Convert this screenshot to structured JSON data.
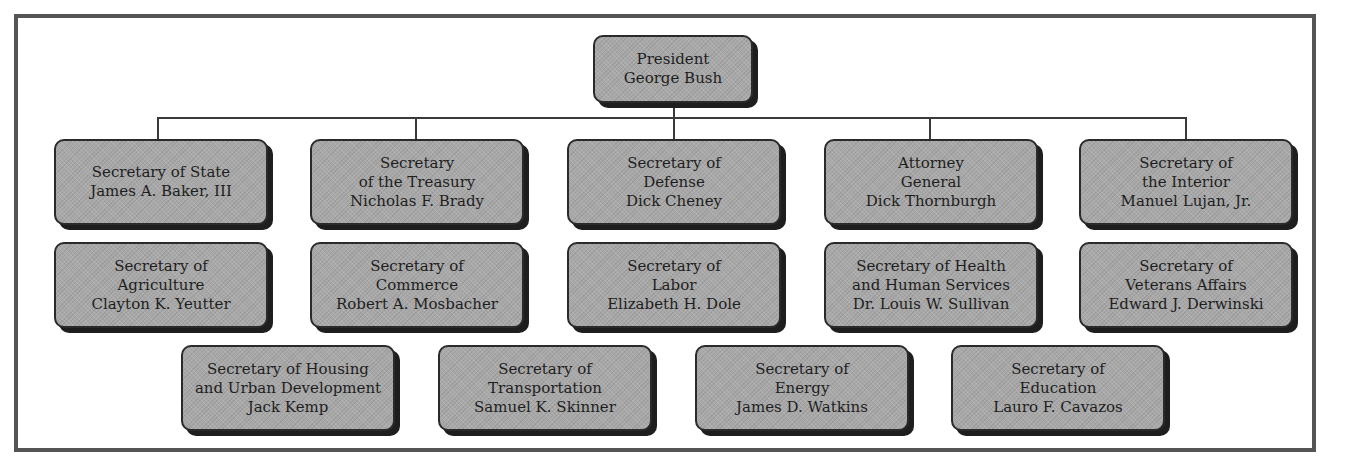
{
  "chart_title": "",
  "president": {
    "lines": [
      "President",
      "George Bush"
    ]
  },
  "cabinet": [
    {
      "lines": [
        "Secretary of State",
        "James A. Baker, III"
      ]
    },
    {
      "lines": [
        "Secretary",
        "of the Treasury",
        "Nicholas F. Brady"
      ]
    },
    {
      "lines": [
        "Secretary of",
        "Defense",
        "Dick Cheney"
      ]
    },
    {
      "lines": [
        "Attorney",
        "General",
        "Dick Thornburgh"
      ]
    },
    {
      "lines": [
        "Secretary of",
        "the Interior",
        "Manuel Lujan, Jr."
      ]
    },
    {
      "lines": [
        "Secretary of",
        "Agriculture",
        "Clayton K. Yeutter"
      ]
    },
    {
      "lines": [
        "Secretary of",
        "Commerce",
        "Robert A. Mosbacher"
      ]
    },
    {
      "lines": [
        "Secretary of",
        "Labor",
        "Elizabeth H. Dole"
      ]
    },
    {
      "lines": [
        "Secretary of Health",
        "and Human Services",
        "Dr. Louis W. Sullivan"
      ]
    },
    {
      "lines": [
        "Secretary of",
        "Veterans Affairs",
        "Edward J. Derwinski"
      ]
    },
    {
      "lines": [
        "Secretary of Housing",
        "and Urban Development",
        "Jack Kemp"
      ]
    },
    {
      "lines": [
        "Secretary of",
        "Transportation",
        "Samuel K. Skinner"
      ]
    },
    {
      "lines": [
        "Secretary of",
        "Energy",
        "James D. Watkins"
      ]
    },
    {
      "lines": [
        "Secretary of",
        "Education",
        "Lauro F. Cavazos"
      ]
    }
  ],
  "colors": {
    "box_fill": "#a8a8a8",
    "box_border": "#2a2a2a",
    "shadow": "#1e1e1e",
    "frame": "#555555",
    "connector": "#3a3a3a"
  }
}
